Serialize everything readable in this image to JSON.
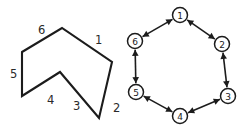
{
  "figure": {
    "background_color": "#ffffff",
    "stroke_color": "#1c1c1c",
    "width": 247,
    "height": 131
  },
  "polygon": {
    "name": "hexagon-outline",
    "label_count": 6,
    "closed": true,
    "vertices": [
      {
        "x": 22,
        "y": 52
      },
      {
        "x": 62,
        "y": 28
      },
      {
        "x": 112,
        "y": 62
      },
      {
        "x": 99,
        "y": 118
      },
      {
        "x": 60,
        "y": 72
      },
      {
        "x": 22,
        "y": 96
      }
    ],
    "edge_labels": [
      {
        "id": "1",
        "text": "1",
        "x": 95,
        "y": 44
      },
      {
        "id": "2",
        "text": "2",
        "x": 113,
        "y": 112
      },
      {
        "id": "3",
        "text": "3",
        "x": 73,
        "y": 110
      },
      {
        "id": "4",
        "text": "4",
        "x": 47,
        "y": 104
      },
      {
        "id": "5",
        "text": "5",
        "x": 10,
        "y": 78
      },
      {
        "id": "6",
        "text": "6",
        "x": 38,
        "y": 34
      }
    ]
  },
  "graph": {
    "name": "hexagonal-cycle-graph",
    "node_radius": 7.5,
    "edge_style": "bidirectional",
    "nodes": [
      {
        "id": "1",
        "label": "1",
        "x": 180,
        "y": 15
      },
      {
        "id": "2",
        "label": "2",
        "x": 222,
        "y": 44
      },
      {
        "id": "3",
        "label": "3",
        "x": 228,
        "y": 96
      },
      {
        "id": "4",
        "label": "4",
        "x": 180,
        "y": 116
      },
      {
        "id": "5",
        "label": "5",
        "x": 136,
        "y": 92
      },
      {
        "id": "6",
        "label": "6",
        "x": 135,
        "y": 41
      }
    ],
    "edges": [
      {
        "from": "1",
        "to": "2",
        "bidirectional": true
      },
      {
        "from": "2",
        "to": "3",
        "bidirectional": true
      },
      {
        "from": "3",
        "to": "4",
        "bidirectional": true
      },
      {
        "from": "4",
        "to": "5",
        "bidirectional": true
      },
      {
        "from": "5",
        "to": "6",
        "bidirectional": true
      },
      {
        "from": "6",
        "to": "1",
        "bidirectional": true
      }
    ]
  }
}
